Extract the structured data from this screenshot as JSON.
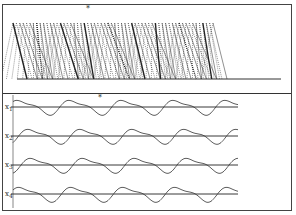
{
  "figure": {
    "top_panel": {
      "name": "stick-figure gait diagram",
      "marker": "*",
      "marker_x": 85
    },
    "bottom_panel": {
      "marker": "*",
      "marker_x": 97,
      "traces": [
        {
          "label": "x",
          "sub": "1"
        },
        {
          "label": "x",
          "sub": "2"
        },
        {
          "label": "x",
          "sub": "3"
        },
        {
          "label": "x",
          "sub": "4"
        }
      ]
    }
  }
}
